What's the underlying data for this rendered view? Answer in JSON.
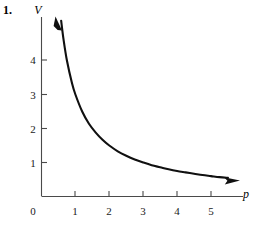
{
  "figure": {
    "problem_number": "1.",
    "background_color": "#ffffff",
    "ink_color": "#101010",
    "axis_color": "#4a4a4a"
  },
  "chart_data": {
    "type": "line",
    "title": "",
    "subtitle": "",
    "xlabel": "p",
    "ylabel": "V",
    "xlim": [
      0,
      5.9
    ],
    "ylim": [
      0,
      5.2
    ],
    "grid": false,
    "legend": false,
    "legend_position": "none",
    "x_ticks": [
      1,
      2,
      3,
      4,
      5
    ],
    "x_tick_labels": [
      "1",
      "2",
      "3",
      "4",
      "5"
    ],
    "y_ticks": [
      1,
      2,
      3,
      4
    ],
    "y_tick_labels": [
      "1",
      "2",
      "3",
      "4"
    ],
    "origin_label": "0",
    "relation": "V = k / p",
    "k": 3,
    "series": [
      {
        "name": "V = 3/p",
        "arrow_start": true,
        "arrow_end": true,
        "x": [
          0.58,
          0.65,
          0.75,
          0.9,
          1.0,
          1.2,
          1.4,
          1.6,
          1.8,
          2.0,
          2.25,
          2.5,
          2.75,
          3.0,
          3.25,
          3.5,
          3.75,
          4.0,
          4.25,
          4.5,
          4.75,
          5.0,
          5.25,
          5.5
        ],
        "y": [
          5.17,
          4.62,
          4.0,
          3.33,
          3.0,
          2.5,
          2.14,
          1.88,
          1.67,
          1.5,
          1.33,
          1.2,
          1.09,
          1.0,
          0.92,
          0.86,
          0.8,
          0.75,
          0.71,
          0.67,
          0.63,
          0.6,
          0.57,
          0.55
        ]
      }
    ],
    "annotations": []
  },
  "icons": {
    "curve_start_arrow": "arrow-up-left-icon",
    "curve_end_arrow": "arrow-right-icon"
  }
}
